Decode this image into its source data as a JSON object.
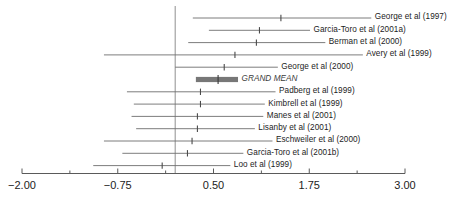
{
  "chart_data": {
    "type": "forest",
    "title": "",
    "xlabel": "",
    "ylabel": "",
    "xlim": [
      -2.0,
      3.0
    ],
    "grid": false,
    "legend": null,
    "reference_line": 0.0,
    "axis": {
      "major_ticks": [
        -2.0,
        -0.75,
        0.5,
        1.75,
        3.0
      ],
      "major_tick_labels": [
        "−2.00",
        "−0.75",
        "0.50",
        "1.75",
        "3.00"
      ],
      "minor_ticks": [
        -1.375,
        -0.125,
        1.125,
        2.375
      ]
    },
    "categories": [
      "George et al (1997)",
      "Garcia-Toro et al (2001a)",
      "Berman et al (2000)",
      "Avery et al (1999)",
      "George et al (2000)",
      "GRAND MEAN",
      "Padberg et al (1999)",
      "Kimbrell et al (1999)",
      "Manes et al (2001)",
      "Lisanby et al (2001)",
      "Eschweiler et al (2000)",
      "Garcia-Toro et al (2001b)",
      "Loo et al (1999)"
    ],
    "rows": [
      {
        "label": "George et al (1997)",
        "effect": 1.38,
        "ci_low": 0.23,
        "ci_high": 2.56,
        "is_summary": false
      },
      {
        "label": "Garcia-Toro et al (2001a)",
        "effect": 1.1,
        "ci_low": 0.44,
        "ci_high": 1.76,
        "is_summary": false
      },
      {
        "label": "Berman et al (2000)",
        "effect": 1.06,
        "ci_low": 0.17,
        "ci_high": 1.96,
        "is_summary": false
      },
      {
        "label": "Avery et al (1999)",
        "effect": 0.78,
        "ci_low": -0.93,
        "ci_high": 2.45,
        "is_summary": false
      },
      {
        "label": "George et al (2000)",
        "effect": 0.64,
        "ci_low": 0.0,
        "ci_high": 1.34,
        "is_summary": false
      },
      {
        "label": "GRAND MEAN",
        "effect": 0.56,
        "ci_low": 0.27,
        "ci_high": 0.82,
        "is_summary": true
      },
      {
        "label": "Padberg et al (1999)",
        "effect": 0.33,
        "ci_low": -0.63,
        "ci_high": 1.31,
        "is_summary": false
      },
      {
        "label": "Kimbrell et al (1999)",
        "effect": 0.33,
        "ci_low": -0.54,
        "ci_high": 1.17,
        "is_summary": false
      },
      {
        "label": "Manes et al (2001)",
        "effect": 0.29,
        "ci_low": -0.57,
        "ci_high": 1.15,
        "is_summary": false
      },
      {
        "label": "Lisanby et al (2001)",
        "effect": 0.29,
        "ci_low": -0.51,
        "ci_high": 1.04,
        "is_summary": false
      },
      {
        "label": "Eschweiler et al (2000)",
        "effect": 0.22,
        "ci_low": -0.93,
        "ci_high": 1.27,
        "is_summary": false
      },
      {
        "label": "Garcia-Toro et al (2001b)",
        "effect": 0.16,
        "ci_low": -0.69,
        "ci_high": 0.89,
        "is_summary": false
      },
      {
        "label": "Loo et al (1999)",
        "effect": -0.17,
        "ci_low": -1.07,
        "ci_high": 0.72,
        "is_summary": false
      }
    ]
  },
  "style": {
    "line_color": "#6e6e6e",
    "marker_color": "#4a4a4a",
    "summary_color": "#777777",
    "axis_color": "#5a5a5a",
    "reference_color": "#9a9a9a",
    "text_color": "#1c1c1c"
  }
}
